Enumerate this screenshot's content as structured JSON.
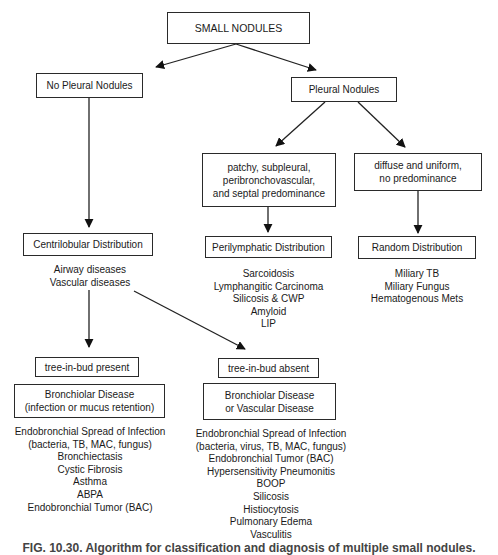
{
  "diagram": {
    "root": "SMALL NODULES",
    "branches": {
      "no_pleural": {
        "label": "No Pleural Nodules",
        "distribution": "Centrilobular Distribution",
        "diseases": [
          "Airway diseases",
          "Vascular diseases"
        ],
        "tib_present": {
          "label": "tree-in-bud present",
          "category": [
            "Bronchiolar Disease",
            "(infection or mucus retention)"
          ],
          "items": [
            "Endobronchial Spread of Infection",
            "(bacteria, TB, MAC, fungus)",
            "Bronchiectasis",
            "Cystic Fibrosis",
            "Asthma",
            "ABPA",
            "Endobronchial Tumor (BAC)"
          ]
        },
        "tib_absent": {
          "label": "tree-in-bud absent",
          "category": [
            "Bronchiolar Disease",
            "or Vascular Disease"
          ],
          "items": [
            "Endobronchial Spread of Infection",
            "(bacteria, virus, TB, MAC, fungus)",
            "Endobronchial Tumor (BAC)",
            "Hypersensitivity Pneumonitis",
            "BOOP",
            "Silicosis",
            "Histiocytosis",
            "Pulmonary Edema",
            "Vasculitis"
          ]
        }
      },
      "pleural": {
        "label": "Pleural Nodules",
        "patchy": {
          "pattern": [
            "patchy, subpleural,",
            "peribronchovascular,",
            "and septal predominance"
          ],
          "distribution": "Perilymphatic Distribution",
          "items": [
            "Sarcoidosis",
            "Lymphangitic Carcinoma",
            "Silicosis & CWP",
            "Amyloid",
            "LIP"
          ]
        },
        "diffuse": {
          "pattern": [
            "diffuse and uniform,",
            "no predominance"
          ],
          "distribution": "Random Distribution",
          "items": [
            "Miliary TB",
            "Miliary Fungus",
            "Hematogenous Mets"
          ]
        }
      }
    },
    "caption": "FIG. 10.30. Algorithm for classification and diagnosis of multiple small nodules."
  }
}
